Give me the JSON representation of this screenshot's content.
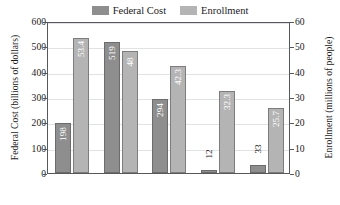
{
  "legend": {
    "items": [
      {
        "label": "Federal Cost",
        "color": "#8e8e8e",
        "name": "federal-cost"
      },
      {
        "label": "Enrollment",
        "color": "#b4b4b4",
        "name": "enrollment"
      }
    ]
  },
  "axes": {
    "left": {
      "title": "Federal Cost (billions of dollars)",
      "ticks": [
        "0",
        "100",
        "200",
        "300",
        "400",
        "500",
        "600"
      ]
    },
    "right": {
      "title": "Enrollment (millions of people)",
      "ticks": [
        "0",
        "10",
        "20",
        "30",
        "40",
        "50",
        "60"
      ]
    }
  },
  "categories": [
    {
      "line1": "Medicaid",
      "line2": ""
    },
    {
      "line1": "Social",
      "line2": "Security"
    },
    {
      "line1": "Medicare",
      "line2": ""
    },
    {
      "line1": "Child",
      "line2": "Nutrition"
    },
    {
      "line1": "Food",
      "line2": "Stamps"
    }
  ],
  "bar_labels": {
    "cost": [
      "198",
      "519",
      "294",
      "12",
      "33"
    ],
    "enrollment": [
      "53.4",
      "48",
      "42.3",
      "32.3",
      "25.7"
    ]
  },
  "chart_data": {
    "type": "bar",
    "title": "",
    "categories": [
      "Medicaid",
      "Social Security",
      "Medicare",
      "Child Nutrition",
      "Food Stamps"
    ],
    "series": [
      {
        "name": "Federal Cost",
        "axis": "left",
        "unit": "billions of dollars",
        "color": "#8e8e8e",
        "values": [
          198,
          519,
          294,
          12,
          33
        ]
      },
      {
        "name": "Enrollment",
        "axis": "right",
        "unit": "millions of people",
        "color": "#b4b4b4",
        "values": [
          53.4,
          48,
          42.3,
          32.3,
          25.7
        ]
      }
    ],
    "xlabel": "",
    "ylabel": "Federal Cost (billions of dollars)",
    "y2label": "Enrollment (millions of people)",
    "ylim": [
      0,
      600
    ],
    "y2lim": [
      0,
      60
    ],
    "yticks": [
      0,
      100,
      200,
      300,
      400,
      500,
      600
    ],
    "y2ticks": [
      0,
      10,
      20,
      30,
      40,
      50,
      60
    ],
    "grid": true,
    "legend_position": "top-center"
  }
}
